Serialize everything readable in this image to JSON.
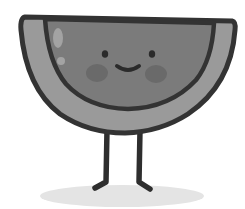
{
  "illustration": {
    "subject": "watermelon slice character",
    "style": "grayscale cartoon",
    "expression": "smiling",
    "colors": {
      "background": "#ffffff",
      "outline": "#333333",
      "rind": "#9a9a9a",
      "flesh": "#7b7b7b",
      "cheek": "#6a6a6a",
      "highlight": "#a3a3a3",
      "eye": "#2b2b2b",
      "leg": "#2e2e2e",
      "shadow": "#e4e4e4"
    }
  }
}
